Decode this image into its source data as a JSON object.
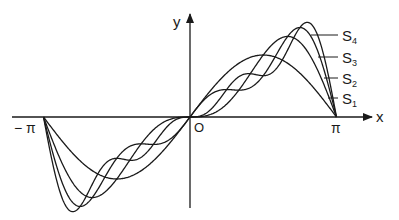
{
  "chart_data": {
    "type": "line",
    "title": "",
    "xlabel": "x",
    "ylabel": "y",
    "x_ticks": [
      "−π",
      "O",
      "π"
    ],
    "xlim": [
      -3.14159,
      3.14159
    ],
    "grid": false,
    "legend_position": "right, leader lines to curves",
    "function": "Fourier partial sums of f(x) = x on (−π, π): S_n(x) = 2 Σ_{k=1..n} (−1)^{k+1} sin(kx)/k",
    "series": [
      {
        "name": "S1",
        "terms": 1
      },
      {
        "name": "S2",
        "terms": 2
      },
      {
        "name": "S3",
        "terms": 3
      },
      {
        "name": "S4",
        "terms": 4
      }
    ]
  },
  "labels": {
    "x_axis": "x",
    "y_axis": "y",
    "neg_pi": "− π",
    "origin": "O",
    "pi": "π",
    "s1": "S",
    "s2": "S",
    "s3": "S",
    "s4": "S",
    "sub1": "1",
    "sub2": "2",
    "sub3": "3",
    "sub4": "4"
  }
}
